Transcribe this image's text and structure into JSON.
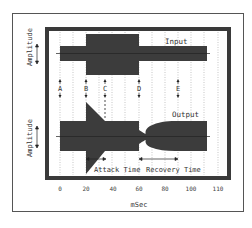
{
  "diagram": {
    "x_axis": {
      "label": "mSec",
      "ticks": [
        "0",
        "20",
        "40",
        "60",
        "80",
        "100",
        "110"
      ]
    },
    "y_axis_labels": {
      "top": "Amplitude",
      "bottom": "Amplitude"
    },
    "panels": {
      "input_label": "Input",
      "output_label": "Output"
    },
    "markers": [
      {
        "id": "A",
        "label": "A",
        "style": "solid"
      },
      {
        "id": "B",
        "label": "B",
        "style": "solid"
      },
      {
        "id": "C",
        "label": "C",
        "style": "dashed"
      },
      {
        "id": "D",
        "label": "D",
        "style": "solid"
      },
      {
        "id": "E",
        "label": "E",
        "style": "solid"
      }
    ],
    "annotations": {
      "attack": "Attack Time",
      "recovery": "Recovery Time"
    },
    "colors": {
      "signal": "#3a3a3a",
      "frame": "#3a3a3a",
      "grid": "#9a9a9a",
      "background": "#ffffff"
    }
  }
}
